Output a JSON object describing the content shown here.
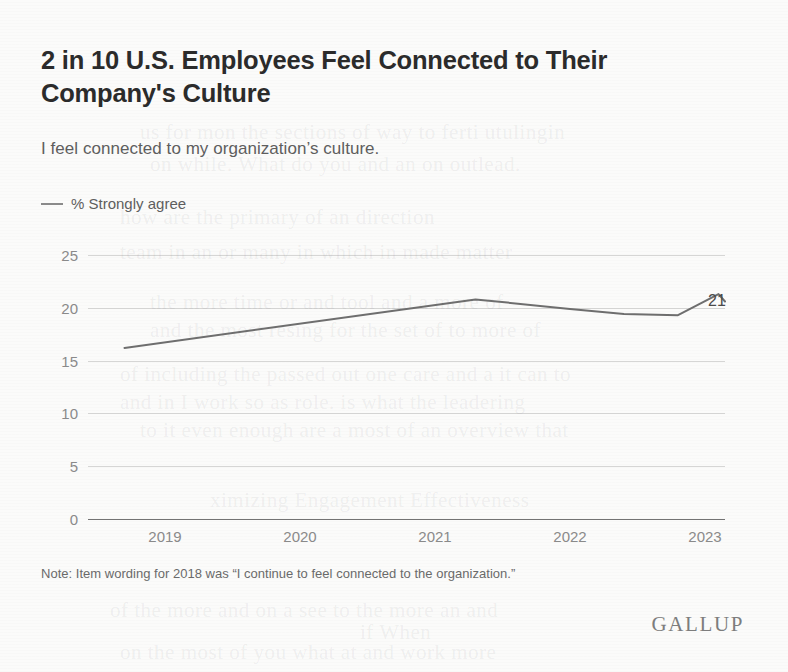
{
  "chart": {
    "title": "2 in 10 U.S. Employees Feel Connected to Their Company's Culture",
    "subtitle": "I feel connected to my organization’s culture.",
    "legend_label": "% Strongly agree",
    "endpoint_label": "21",
    "note": "Note: Item wording for 2018 was “I continue to feel connected to the organization.”",
    "brand": "GALLUP"
  },
  "colors": {
    "line": "#6e6e6e",
    "text_primary": "#2b2b2b",
    "text_secondary": "#5e5e5e",
    "axis_text": "#8a8a8a",
    "gridline": "#bdbdbd",
    "background": "#fbfbfa"
  },
  "ghost_text": [
    {
      "text": "us for mon the sections of way to ferti utulingin",
      "x": 140,
      "y": 120
    },
    {
      "text": "on while. What do you and an on outlead.",
      "x": 150,
      "y": 152
    },
    {
      "text": "how are the primary of an direction",
      "x": 120,
      "y": 205
    },
    {
      "text": "team in an or many in which in made matter",
      "x": 120,
      "y": 240
    },
    {
      "text": "the more time or and tool and a more of",
      "x": 150,
      "y": 290
    },
    {
      "text": "and the most resing for the set of to more of",
      "x": 150,
      "y": 318
    },
    {
      "text": "of including the passed out one care and a it can to",
      "x": 120,
      "y": 362
    },
    {
      "text": "and in I work so as role. is what the leadering",
      "x": 120,
      "y": 390
    },
    {
      "text": "to it even enough are a most of an overview that",
      "x": 140,
      "y": 418
    },
    {
      "text": "ximizing Engagement Effectiveness",
      "x": 210,
      "y": 488
    },
    {
      "text": "of the more and on a see to the more an and",
      "x": 110,
      "y": 598
    },
    {
      "text": "if When",
      "x": 360,
      "y": 620
    },
    {
      "text": "on the most of you what at and work more",
      "x": 120,
      "y": 640
    }
  ],
  "chart_data": {
    "type": "line",
    "title": "2 in 10 U.S. Employees Feel Connected to Their Company's Culture",
    "subtitle": "I feel connected to my organization’s culture.",
    "xlabel": "",
    "ylabel": "",
    "ylim": [
      0,
      25
    ],
    "yticks": [
      0,
      5,
      10,
      15,
      20,
      25
    ],
    "xticks": [
      "2019",
      "2020",
      "2021",
      "2022",
      "2023"
    ],
    "grid": true,
    "legend_position": "above-plot-left",
    "series": [
      {
        "name": "% Strongly agree",
        "color": "#6e6e6e",
        "points": [
          {
            "x": 2018.7,
            "y": 16.2
          },
          {
            "x": 2021.3,
            "y": 20.8
          },
          {
            "x": 2022.0,
            "y": 19.9
          },
          {
            "x": 2022.4,
            "y": 19.4
          },
          {
            "x": 2022.8,
            "y": 19.3
          },
          {
            "x": 2023.1,
            "y": 21.3
          },
          {
            "x": 2023.4,
            "y": 20.6
          }
        ],
        "end_value": 21
      }
    ]
  }
}
